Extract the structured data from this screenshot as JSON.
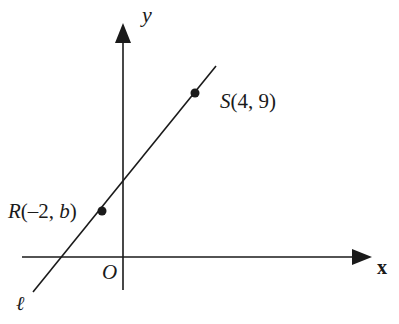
{
  "diagram": {
    "type": "coordinate-plane",
    "axes": {
      "x_label": "x",
      "y_label": "y",
      "origin_label": "O"
    },
    "line": {
      "name": "ℓ",
      "slope_direction": "positive"
    },
    "points": [
      {
        "name": "S",
        "label": "S(4, 9)",
        "label_prefix": "S",
        "label_coords": "(4, 9)",
        "x": 4,
        "y": 9
      },
      {
        "name": "R",
        "label": "R(–2, b)",
        "label_prefix": "R",
        "label_coords_open": "(–2, ",
        "label_coords_var": "b",
        "label_coords_close": ")",
        "x": -2,
        "y": "b"
      }
    ],
    "colors": {
      "ink": "#1a1a1a",
      "background": "#ffffff"
    }
  }
}
